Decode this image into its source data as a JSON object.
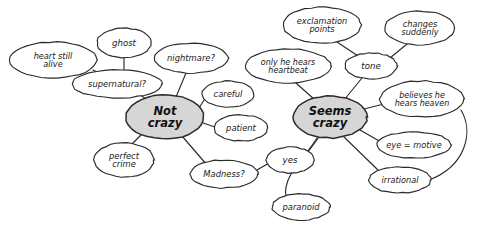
{
  "diagram": {
    "background_color": "#ffffff",
    "ink_color": "#2b2b2b",
    "hub_fill_color": "#d6d6d6",
    "node_fill_color": "#ffffff",
    "style": "hand-drawn"
  },
  "nodes": [
    {
      "id": "heart-still-alive",
      "lines": [
        "heart still",
        "alive"
      ],
      "text": "heart still alive",
      "kind": "leaf",
      "cx": 53,
      "cy": 60,
      "rx": 44,
      "ry": 18,
      "font_size": 8.2
    },
    {
      "id": "ghost",
      "lines": [
        "ghost"
      ],
      "text": "ghost",
      "kind": "leaf",
      "cx": 124,
      "cy": 43,
      "rx": 27,
      "ry": 15,
      "font_size": 8.6
    },
    {
      "id": "supernatural",
      "lines": [
        "supernatural?"
      ],
      "text": "supernatural?",
      "kind": "leaf",
      "cx": 117,
      "cy": 84,
      "rx": 45,
      "ry": 14,
      "font_size": 8.4
    },
    {
      "id": "nightmare",
      "lines": [
        "nightmare?"
      ],
      "text": "nightmare?",
      "kind": "leaf",
      "cx": 191,
      "cy": 58,
      "rx": 37,
      "ry": 15,
      "font_size": 8.4
    },
    {
      "id": "not-crazy",
      "lines": [
        "Not",
        "crazy"
      ],
      "text": "Not crazy",
      "kind": "hub",
      "cx": 165,
      "cy": 117,
      "rx": 39,
      "ry": 22,
      "font_size": 11.5
    },
    {
      "id": "careful",
      "lines": [
        "careful"
      ],
      "text": "careful",
      "kind": "leaf",
      "cx": 228,
      "cy": 94,
      "rx": 26,
      "ry": 13,
      "font_size": 8.4
    },
    {
      "id": "patient",
      "lines": [
        "patient"
      ],
      "text": "patient",
      "kind": "leaf",
      "cx": 241,
      "cy": 128,
      "rx": 27,
      "ry": 13,
      "font_size": 8.4
    },
    {
      "id": "perfect-crime",
      "lines": [
        "perfect",
        "crime"
      ],
      "text": "perfect crime",
      "kind": "leaf",
      "cx": 124,
      "cy": 160,
      "rx": 30,
      "ry": 17,
      "font_size": 8.4
    },
    {
      "id": "madness",
      "lines": [
        "Madness?"
      ],
      "text": "Madness?",
      "kind": "leaf",
      "cx": 224,
      "cy": 174,
      "rx": 34,
      "ry": 14,
      "font_size": 8.4
    },
    {
      "id": "exclamation-points",
      "lines": [
        "exclamation",
        "points"
      ],
      "text": "exclamation points",
      "kind": "leaf",
      "cx": 322,
      "cy": 25,
      "rx": 39,
      "ry": 18,
      "font_size": 8.2
    },
    {
      "id": "changes-suddenly",
      "lines": [
        "changes",
        "suddenly"
      ],
      "text": "changes suddenly",
      "kind": "leaf",
      "cx": 420,
      "cy": 28,
      "rx": 35,
      "ry": 17,
      "font_size": 8.2
    },
    {
      "id": "tone",
      "lines": [
        "tone"
      ],
      "text": "tone",
      "kind": "leaf",
      "cx": 371,
      "cy": 66,
      "rx": 26,
      "ry": 13,
      "font_size": 8.6
    },
    {
      "id": "only-he-hears-heartbeat",
      "lines": [
        "only he hears",
        "heartbeat"
      ],
      "text": "only he hears heartbeat",
      "kind": "leaf",
      "cx": 288,
      "cy": 66,
      "rx": 43,
      "ry": 17,
      "font_size": 8.0
    },
    {
      "id": "seems-crazy",
      "lines": [
        "Seems",
        "crazy"
      ],
      "text": "Seems crazy",
      "kind": "hub",
      "cx": 330,
      "cy": 117,
      "rx": 37,
      "ry": 21,
      "font_size": 11.5
    },
    {
      "id": "believes-he-hears-heaven",
      "lines": [
        "believes he",
        "hears heaven"
      ],
      "text": "believes he hears heaven",
      "kind": "leaf",
      "cx": 422,
      "cy": 99,
      "rx": 42,
      "ry": 18,
      "font_size": 8.0
    },
    {
      "id": "eye-motive",
      "lines": [
        "eye = motive"
      ],
      "text": "eye = motive",
      "kind": "leaf",
      "cx": 414,
      "cy": 145,
      "rx": 37,
      "ry": 13,
      "font_size": 8.2
    },
    {
      "id": "irrational",
      "lines": [
        "irrational"
      ],
      "text": "irrational",
      "kind": "leaf",
      "cx": 400,
      "cy": 180,
      "rx": 31,
      "ry": 13,
      "font_size": 8.2
    },
    {
      "id": "yes",
      "lines": [
        "yes"
      ],
      "text": "yes",
      "kind": "leaf",
      "cx": 290,
      "cy": 160,
      "rx": 24,
      "ry": 13,
      "font_size": 8.6
    },
    {
      "id": "paranoid",
      "lines": [
        "paranoid"
      ],
      "text": "paranoid",
      "kind": "leaf",
      "cx": 301,
      "cy": 207,
      "rx": 29,
      "ry": 13,
      "font_size": 8.4
    }
  ],
  "edges": [
    {
      "id": "heart-still-alive--supernatural",
      "from": "heart still alive",
      "to": "supernatural?",
      "path": "M 93,70 L 112,79"
    },
    {
      "id": "ghost--supernatural",
      "from": "ghost",
      "to": "supernatural?",
      "path": "M 124,58 L 124,70"
    },
    {
      "id": "supernatural--not-crazy",
      "from": "supernatural?",
      "to": "Not crazy",
      "path": "M 139,94 L 153,104"
    },
    {
      "id": "nightmare--not-crazy",
      "from": "nightmare?",
      "to": "Not crazy",
      "path": "M 186,73 L 176,97"
    },
    {
      "id": "not-crazy--careful",
      "from": "Not crazy",
      "to": "careful",
      "path": "M 199,108 L 206,97"
    },
    {
      "id": "not-crazy--patient",
      "from": "Not crazy",
      "to": "patient",
      "path": "M 203,123 L 215,127"
    },
    {
      "id": "not-crazy--perfect-crime",
      "from": "Not crazy",
      "to": "perfect crime",
      "path": "M 142,134 L 132,144"
    },
    {
      "id": "not-crazy--madness",
      "from": "Not crazy",
      "to": "Madness?",
      "path": "M 182,136 L 207,165"
    },
    {
      "id": "madness--yes",
      "from": "Madness?",
      "to": "yes",
      "path": "M 257,170 L 269,163"
    },
    {
      "id": "yes--seems-crazy",
      "from": "yes",
      "to": "Seems crazy",
      "path": "M 308,152 L 319,137"
    },
    {
      "id": "paranoid--seems-crazy",
      "from": "paranoid",
      "to": "Seems crazy",
      "path": "M 286,197 C 282,176 305,158 317,138"
    },
    {
      "id": "only-he-hears-heartbeat--seems-crazy",
      "from": "only he hears heartbeat",
      "to": "Seems crazy",
      "path": "M 296,83 L 315,100"
    },
    {
      "id": "tone--seems-crazy",
      "from": "tone",
      "to": "Seems crazy",
      "path": "M 362,78 L 344,100"
    },
    {
      "id": "tone--exclamation-points",
      "from": "tone",
      "to": "exclamation points",
      "path": "M 358,56 L 337,42"
    },
    {
      "id": "tone--changes-suddenly",
      "from": "tone",
      "to": "changes suddenly",
      "path": "M 390,58 L 407,44"
    },
    {
      "id": "seems-crazy--believes-he-hears-heaven",
      "from": "Seems crazy",
      "to": "believes he hears heaven",
      "path": "M 364,109 L 384,104"
    },
    {
      "id": "seems-crazy--eye-motive",
      "from": "Seems crazy",
      "to": "eye = motive",
      "path": "M 360,130 L 381,142"
    },
    {
      "id": "seems-crazy--irrational",
      "from": "Seems crazy",
      "to": "irrational",
      "path": "M 344,137 L 378,170"
    },
    {
      "id": "believes-he-hears-heaven--irrational",
      "from": "believes he hears heaven",
      "to": "irrational",
      "path": "M 461,110 C 474,132 466,166 429,180"
    }
  ]
}
